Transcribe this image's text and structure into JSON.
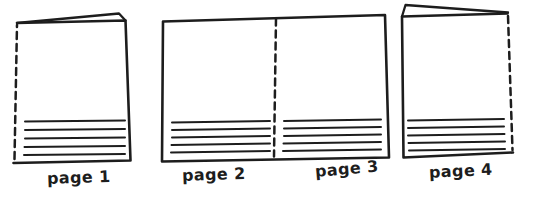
{
  "figure": {
    "background_color": "#ffffff",
    "ink_color": "#1d1d1d",
    "panels": [
      {
        "label": "page 1"
      },
      {
        "label": "page 2"
      },
      {
        "label": "page 3"
      },
      {
        "label": "page 4"
      }
    ]
  }
}
